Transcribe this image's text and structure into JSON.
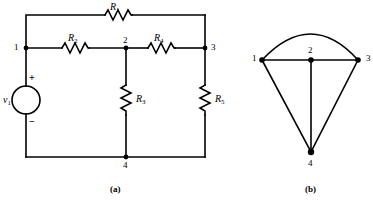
{
  "figure": {
    "panel_a": {
      "caption": "(a)",
      "type": "circuit-schematic",
      "source": {
        "name": "v1",
        "symbol": "v",
        "subscript": "1",
        "plus": "+",
        "minus": "−"
      },
      "resistors": [
        {
          "id": "R1",
          "symbol": "R",
          "subscript": "1",
          "orientation": "horizontal",
          "between": [
            "1",
            "3"
          ]
        },
        {
          "id": "R2",
          "symbol": "R",
          "subscript": "2",
          "orientation": "horizontal",
          "between": [
            "1",
            "2"
          ]
        },
        {
          "id": "R3",
          "symbol": "R",
          "subscript": "3",
          "orientation": "vertical",
          "between": [
            "2",
            "4"
          ]
        },
        {
          "id": "R4",
          "symbol": "R",
          "subscript": "4",
          "orientation": "horizontal",
          "between": [
            "2",
            "3"
          ]
        },
        {
          "id": "R5",
          "symbol": "R",
          "subscript": "5",
          "orientation": "vertical",
          "between": [
            "3",
            "4"
          ]
        }
      ],
      "nodes": [
        {
          "id": "n1",
          "label": "1"
        },
        {
          "id": "n2",
          "label": "2"
        },
        {
          "id": "n3",
          "label": "3"
        },
        {
          "id": "n4",
          "label": "4"
        }
      ]
    },
    "panel_b": {
      "caption": "(b)",
      "type": "circuit-graph",
      "nodes": [
        {
          "id": "g1",
          "label": "1"
        },
        {
          "id": "g2",
          "label": "2"
        },
        {
          "id": "g3",
          "label": "3"
        },
        {
          "id": "g4",
          "label": "4"
        }
      ],
      "edges": [
        {
          "from": "1",
          "to": "3",
          "shape": "arc"
        },
        {
          "from": "1",
          "to": "2",
          "shape": "line"
        },
        {
          "from": "2",
          "to": "3",
          "shape": "line"
        },
        {
          "from": "1",
          "to": "4",
          "shape": "line"
        },
        {
          "from": "2",
          "to": "4",
          "shape": "line"
        },
        {
          "from": "3",
          "to": "4",
          "shape": "line"
        }
      ]
    },
    "colors": {
      "ink": "#000000",
      "background": "#ffffff"
    }
  }
}
